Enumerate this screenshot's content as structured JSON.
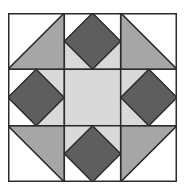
{
  "figure": {
    "kind": "quilt-block",
    "grid": {
      "rows": 3,
      "cols": 3
    },
    "colors": {
      "white": "#ffffff",
      "light": "#d9d9d9",
      "medium": "#a6a6a6",
      "dark": "#5e5e5e",
      "stroke": "#2b2b2b"
    },
    "blocks": [
      {
        "pos": "top-left",
        "type": "half-square-triangle",
        "diagonal": "bl-tr",
        "medium_half": "lower-right",
        "white_half": "upper-left"
      },
      {
        "pos": "top-center",
        "type": "diamond-in-square",
        "diamond": "dark",
        "corners": {
          "top-left": "white",
          "top-right": "white",
          "bottom-left": "light",
          "bottom-right": "light"
        }
      },
      {
        "pos": "top-right",
        "type": "half-square-triangle",
        "diagonal": "tl-br",
        "medium_half": "lower-left",
        "white_half": "upper-right"
      },
      {
        "pos": "middle-left",
        "type": "diamond-in-square",
        "diamond": "dark",
        "corners": {
          "top-left": "white",
          "top-right": "light",
          "bottom-left": "white",
          "bottom-right": "light"
        }
      },
      {
        "pos": "center",
        "type": "plain-square",
        "fill": "light"
      },
      {
        "pos": "middle-right",
        "type": "diamond-in-square",
        "diamond": "dark",
        "corners": {
          "top-left": "light",
          "top-right": "white",
          "bottom-left": "light",
          "bottom-right": "white"
        }
      },
      {
        "pos": "bottom-left",
        "type": "half-square-triangle",
        "diagonal": "tl-br",
        "medium_half": "upper-right",
        "white_half": "lower-left"
      },
      {
        "pos": "bottom-center",
        "type": "diamond-in-square",
        "diamond": "dark",
        "corners": {
          "top-left": "light",
          "top-right": "light",
          "bottom-left": "white",
          "bottom-right": "white"
        }
      },
      {
        "pos": "bottom-right",
        "type": "half-square-triangle",
        "diagonal": "bl-tr",
        "medium_half": "upper-left",
        "white_half": "lower-right"
      }
    ]
  }
}
